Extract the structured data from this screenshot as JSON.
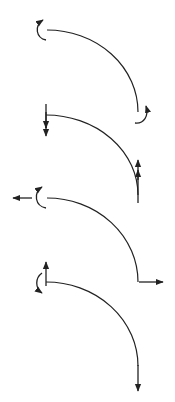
{
  "diagram": {
    "type": "curved-beam-load-cases",
    "stroke_color": "#222222",
    "background": "#ffffff",
    "panels": [
      {
        "id": 1,
        "left_end": "counterclockwise-moment",
        "right_end": "counterclockwise-moment"
      },
      {
        "id": 2,
        "left_end": "double-arrow-down",
        "right_end": "double-arrow-up"
      },
      {
        "id": 3,
        "left_end": "moment-plus-horizontal-force-left",
        "right_end": "horizontal-force-right"
      },
      {
        "id": 4,
        "left_end": "moment-plus-vertical-force-up",
        "right_end": "vertical-force-down"
      }
    ]
  }
}
